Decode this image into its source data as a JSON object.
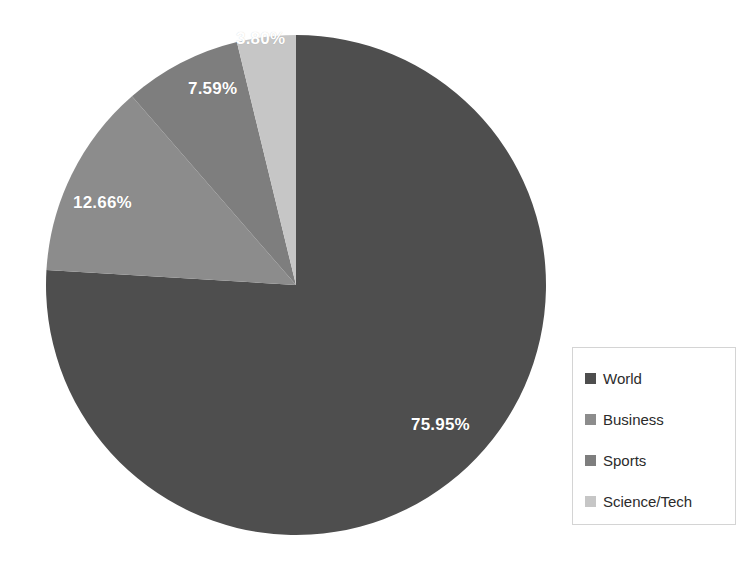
{
  "chart_data": {
    "type": "pie",
    "title": "",
    "subtitle": "",
    "xlabel": "",
    "ylabel": "",
    "grid": false,
    "legend_position": "right",
    "start_angle_deg": 0,
    "direction": "clockwise",
    "categories": [
      "World",
      "Business",
      "Sports",
      "Science/Tech"
    ],
    "values": [
      75.95,
      12.66,
      7.59,
      3.8
    ],
    "value_unit": "percent",
    "data_labels": [
      "75.95%",
      "12.66%",
      "7.59%",
      "3.80%"
    ],
    "colors": [
      "#4e4e4e",
      "#8c8c8c",
      "#7e7e7e",
      "#c6c6c6"
    ],
    "slices": [
      {
        "label": "World",
        "value": 75.95,
        "data_label": "75.95%",
        "color": "#4e4e4e"
      },
      {
        "label": "Business",
        "value": 12.66,
        "data_label": "12.66%",
        "color": "#8c8c8c"
      },
      {
        "label": "Sports",
        "value": 7.59,
        "data_label": "7.59%",
        "color": "#7e7e7e"
      },
      {
        "label": "Science/Tech",
        "value": 3.8,
        "data_label": "3.80%",
        "color": "#c6c6c6"
      }
    ]
  },
  "pie": {
    "labels": {
      "world": "75.95%",
      "business": "12.66%",
      "sports": "7.59%",
      "science_tech": "3.80%"
    }
  },
  "legend": {
    "items": [
      {
        "label": "World",
        "color": "#4e4e4e"
      },
      {
        "label": "Business",
        "color": "#8c8c8c"
      },
      {
        "label": "Sports",
        "color": "#7e7e7e"
      },
      {
        "label": "Science/Tech",
        "color": "#c6c6c6"
      }
    ]
  }
}
